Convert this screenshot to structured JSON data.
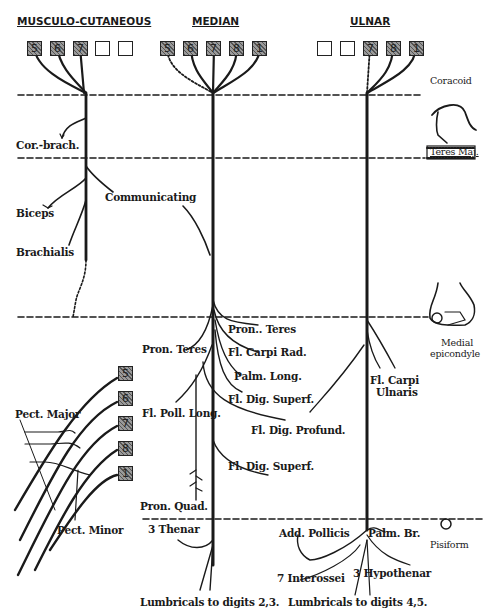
{
  "headers": {
    "musculo_cutaneous": "MUSCULO-CUTANEOUS",
    "median": "MEDIAN",
    "ulnar": "ULNAR"
  },
  "root_boxes": {
    "musculo_cutaneous": [
      {
        "label": "5",
        "shaded": true
      },
      {
        "label": "6",
        "shaded": true
      },
      {
        "label": "7",
        "shaded": true
      },
      {
        "label": "",
        "shaded": false
      },
      {
        "label": "",
        "shaded": false
      }
    ],
    "median": [
      {
        "label": "5",
        "shaded": true
      },
      {
        "label": "6",
        "shaded": true
      },
      {
        "label": "7",
        "shaded": true
      },
      {
        "label": "8",
        "shaded": true
      },
      {
        "label": "1",
        "shaded": true
      }
    ],
    "ulnar": [
      {
        "label": "",
        "shaded": false
      },
      {
        "label": "",
        "shaded": false
      },
      {
        "label": "7",
        "shaded": true
      },
      {
        "label": "8",
        "shaded": true
      },
      {
        "label": "1",
        "shaded": true
      }
    ],
    "pectoral": [
      {
        "label": "5",
        "shaded": true
      },
      {
        "label": "6",
        "shaded": true
      },
      {
        "label": "7",
        "shaded": true
      },
      {
        "label": "8",
        "shaded": true
      },
      {
        "label": "1",
        "shaded": true
      }
    ]
  },
  "landmarks": {
    "coracoid": "Coracoid",
    "teres_major": "Teres Maj.",
    "medial_epicondyle_line1": "Medial",
    "medial_epicondyle_line2": "epicondyle",
    "pisiform": "Pisiform"
  },
  "musculo_cutaneous_branches": {
    "cor_brach": "Cor.-brach.",
    "biceps": "Biceps",
    "brachialis": "Brachialis",
    "communicating": "Communicating"
  },
  "median_branches": {
    "pron_teres_right": "Pron.. Teres",
    "pron_teres_left": "Pron. Teres",
    "fl_carpi_rad": "Fl. Carpi Rad.",
    "palm_long": "Palm. Long.",
    "fl_dig_superf_1": "Fl. Dig. Superf.",
    "fl_poll_long": "Fl. Poll. Long.",
    "fl_dig_profund": "Fl. Dig. Profund.",
    "fl_dig_superf_2": "Fl. Dig. Superf.",
    "pron_quad": "Pron. Quad.",
    "thenar": "3 Thenar",
    "lumbricals": "Lumbricals to digits 2,3."
  },
  "ulnar_branches": {
    "fl_carpi_ulnaris_line1": "Fl. Carpi",
    "fl_carpi_ulnaris_line2": "Ulnaris",
    "add_pollicis": "Add. Pollicis",
    "palm_br": "Palm. Br.",
    "interossei": "7 Interossei",
    "hypothenar": "3 Hypothenar",
    "lumbricals": "Lumbricals to digits 4,5."
  },
  "pectoral_branches": {
    "pect_major": "Pect. Major",
    "pect_minor": "Pect. Minor"
  },
  "colors": {
    "ink": "#1a1a1a",
    "background": "#ffffff"
  }
}
